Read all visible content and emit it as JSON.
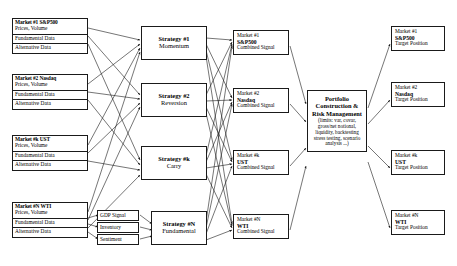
{
  "diagram": {
    "sources": [
      {
        "name": "Market #1 S&P500",
        "sub": "Prices, Volume",
        "row2": "Fundamental Data",
        "row3": "Alternative Data"
      },
      {
        "name": "Market #2 Nasdaq",
        "sub": "Prices, Volume",
        "row2": "Fundamental Data",
        "row3": "Alternative Data"
      },
      {
        "name": "Market #k UST",
        "sub": "Prices, Volume",
        "row2": "Fundamental Data",
        "row3": "Alternative Data"
      },
      {
        "name": "Market #N WTI",
        "sub": "Prices, Volume",
        "row2": "Fundamental Data",
        "row3": "Alternative Data"
      }
    ],
    "features": [
      {
        "label": "GDP Signal"
      },
      {
        "label": "Inventory"
      },
      {
        "label": "Sentiment"
      }
    ],
    "strategies": [
      {
        "id": "Strategy #1",
        "name": "Momentum"
      },
      {
        "id": "Strategy #2",
        "name": "Reversion"
      },
      {
        "id": "Strategy #k",
        "name": "Carry"
      },
      {
        "id": "Strategy #N",
        "name": "Fundamental"
      }
    ],
    "signals": [
      {
        "market": "Market #1",
        "asset": "S&P500",
        "kind": "Combined Signal"
      },
      {
        "market": "Market #2",
        "asset": "Nasdaq",
        "kind": "Combined Signal"
      },
      {
        "market": "Market #k",
        "asset": "UST",
        "kind": "Combined Signal"
      },
      {
        "market": "Market #N",
        "asset": "WTI",
        "kind": "Combined Signal"
      }
    ],
    "portfolio": {
      "header": "Portfolio Construction & Risk Management",
      "body": "(limits: var, covar, gross/net notional, liquidity, backtesting stress testing, scenario analysis ...)"
    },
    "targets": [
      {
        "market": "Market #1",
        "asset": "S&P500",
        "kind": "Target Position"
      },
      {
        "market": "Market #2",
        "asset": "Nasdaq",
        "kind": "Target Position"
      },
      {
        "market": "Market #k",
        "asset": "UST",
        "kind": "Target Position"
      },
      {
        "market": "Market #N",
        "asset": "WTI",
        "kind": "Target Position"
      }
    ],
    "colors": {
      "stroke": "#1a1a1a",
      "background": "#ffffff",
      "text": "#000000"
    }
  }
}
